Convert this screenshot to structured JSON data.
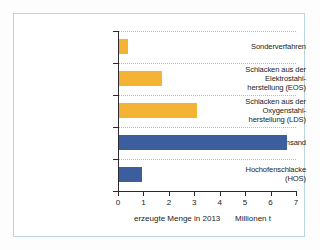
{
  "chart_data": {
    "type": "bar",
    "orientation": "horizontal",
    "title": "",
    "xlabel": "erzeugte Menge in 2013",
    "unit_label": "Millionen t",
    "ylabel": "",
    "xlim": [
      0,
      7
    ],
    "xticks": [
      0,
      1,
      2,
      3,
      4,
      5,
      6,
      7
    ],
    "grid": true,
    "grid_orientation": "horizontal",
    "legend": "none",
    "categories": [
      "Sonderverfahren",
      "Schlacken aus der Elektrostahl-herstellung (EOS)",
      "Schlacken aus der Oxygenstahl-herstellung (LDS)",
      "Hüttensand",
      "Hochofenschlacke (HOS)"
    ],
    "values": [
      0.35,
      1.7,
      3.05,
      6.6,
      0.9
    ],
    "colors": [
      "#f5b335",
      "#f5b335",
      "#f5b335",
      "#3d5e9e",
      "#3d5e9e"
    ]
  },
  "categories_display": [
    {
      "lines": [
        "Sonderverfahren"
      ]
    },
    {
      "lines": [
        "Schlacken aus der",
        "Elektrostahl-",
        "herstellung (EOS)"
      ]
    },
    {
      "lines": [
        "Schlacken aus der",
        "Oxygenstahl-",
        "herstellung (LDS)"
      ]
    },
    {
      "lines": [
        "Hüttensand"
      ]
    },
    {
      "lines": [
        "Hochofenschlacke",
        "(HOS)"
      ]
    }
  ],
  "axis": {
    "tick_labels": [
      "0",
      "1",
      "2",
      "3",
      "4",
      "5",
      "6",
      "7"
    ]
  },
  "caption": {
    "main": "erzeugte Menge in 2013",
    "unit": "Millionen t"
  },
  "colors": {
    "orange": "#f5b335",
    "blue": "#3d5e9e",
    "grid": "#9cc3dd",
    "axis": "#2b2b2b",
    "frame": "#b9d4e2"
  }
}
